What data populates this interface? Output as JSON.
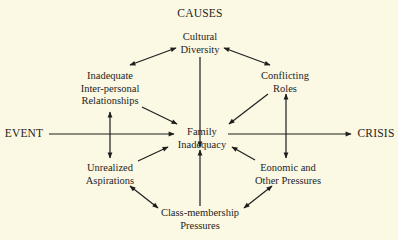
{
  "diagram": {
    "title": "CAUSES",
    "nodes": {
      "cultural_diversity": [
        "Cultural",
        "Diversity"
      ],
      "inter_personal": [
        "Inadequate",
        "Inter-personal",
        "Relationships"
      ],
      "conflicting_roles": [
        "Conflicting",
        "Roles"
      ],
      "family_inadequacy": [
        "Family",
        "Inadequacy"
      ],
      "unrealized_aspirations": [
        "Unrealized",
        "Aspirations"
      ],
      "economic_pressures": [
        "Eonomic and",
        "Other Pressures"
      ],
      "class_membership": [
        "Class-membership",
        "Pressures"
      ],
      "event": "EVENT",
      "crisis": "CRISIS"
    },
    "edges": [
      {
        "from": "Cultural Diversity",
        "to": "Inadequate Inter-personal Relationships",
        "type": "bidirectional"
      },
      {
        "from": "Cultural Diversity",
        "to": "Conflicting Roles",
        "type": "bidirectional"
      },
      {
        "from": "Cultural Diversity",
        "to": "Family Inadequacy",
        "type": "directed"
      },
      {
        "from": "Inadequate Inter-personal Relationships",
        "to": "Family Inadequacy",
        "type": "directed"
      },
      {
        "from": "Conflicting Roles",
        "to": "Family Inadequacy",
        "type": "directed"
      },
      {
        "from": "EVENT",
        "to": "Family Inadequacy",
        "type": "directed"
      },
      {
        "from": "EVENT line",
        "to": "Inadequate Inter-personal Relationships",
        "type": "directed"
      },
      {
        "from": "EVENT line",
        "to": "Unrealized Aspirations",
        "type": "directed"
      },
      {
        "from": "Family Inadequacy",
        "to": "CRISIS",
        "type": "directed"
      },
      {
        "from": "CRISIS line",
        "to": "Conflicting Roles",
        "type": "directed"
      },
      {
        "from": "CRISIS line",
        "to": "Eonomic and Other Pressures",
        "type": "directed"
      },
      {
        "from": "Unrealized Aspirations",
        "to": "Family Inadequacy",
        "type": "directed"
      },
      {
        "from": "Eonomic and Other Pressures",
        "to": "Family Inadequacy",
        "type": "directed"
      },
      {
        "from": "Class-membership Pressures",
        "to": "Family Inadequacy",
        "type": "directed"
      },
      {
        "from": "Unrealized Aspirations",
        "to": "Class-membership Pressures",
        "type": "bidirectional"
      },
      {
        "from": "Eonomic and Other Pressures",
        "to": "Class-membership Pressures",
        "type": "bidirectional"
      }
    ]
  }
}
